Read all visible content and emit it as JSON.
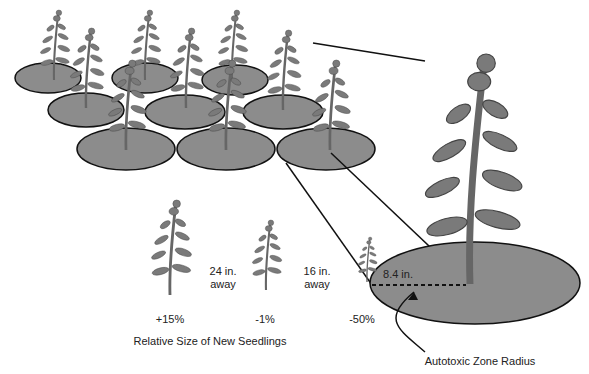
{
  "diagram": {
    "title": "Relative Size of New Seedlings",
    "distances": [
      {
        "value": "24 in.",
        "unit_label": "away"
      },
      {
        "value": "16 in.",
        "unit_label": "away"
      }
    ],
    "seedling_sizes": [
      "+15%",
      "-1%",
      "-50%"
    ],
    "radius_label": "8.4 in.",
    "zone_label": "Autotoxic Zone Radius",
    "colors": {
      "zone_fill": "#8c8c8c",
      "plant_fill": "#7a7a7a",
      "outline": "#111111"
    }
  }
}
